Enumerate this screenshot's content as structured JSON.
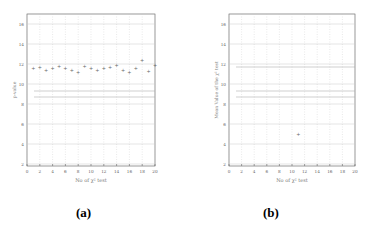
{
  "captions": {
    "a": "(a)",
    "b": "(b)"
  },
  "chart_data": [
    {
      "type": "scatter",
      "panel": "(a)",
      "title": "",
      "xlabel": "No of χ² test",
      "ylabel": "p-value",
      "xlim": [
        0,
        20
      ],
      "ylim": [
        1.8,
        17
      ],
      "xticks": [
        0,
        2,
        4,
        6,
        8,
        10,
        12,
        14,
        16,
        18,
        20
      ],
      "yticks": [
        2,
        4,
        6,
        8,
        10,
        12,
        14,
        16
      ],
      "grid": true,
      "series": [
        {
          "name": "test values",
          "x": [
            1,
            2,
            3,
            4,
            5,
            6,
            7,
            8,
            9,
            10,
            11,
            12,
            13,
            14,
            15,
            16,
            17,
            18,
            19,
            20
          ],
          "y": [
            11.6,
            11.7,
            11.4,
            11.6,
            11.8,
            11.6,
            11.4,
            11.2,
            11.8,
            11.6,
            11.4,
            11.6,
            11.7,
            11.9,
            11.4,
            11.2,
            11.6,
            12.4,
            11.3,
            11.9
          ]
        }
      ],
      "reference_lines": [
        9.3,
        8.7
      ]
    },
    {
      "type": "scatter",
      "panel": "(b)",
      "title": "",
      "xlabel": "No of χ² test",
      "ylabel": "Mean Value of the χ² test",
      "xlim": [
        0,
        20
      ],
      "ylim": [
        1.8,
        17
      ],
      "xticks": [
        0,
        2,
        4,
        6,
        8,
        10,
        12,
        14,
        16,
        18,
        20
      ],
      "yticks": [
        2,
        4,
        6,
        8,
        10,
        12,
        14,
        16
      ],
      "grid": true,
      "series": [
        {
          "name": "mean",
          "x": [
            11
          ],
          "y": [
            5.0
          ]
        }
      ],
      "reference_lines": [
        11.7,
        9.3,
        8.7
      ]
    }
  ]
}
